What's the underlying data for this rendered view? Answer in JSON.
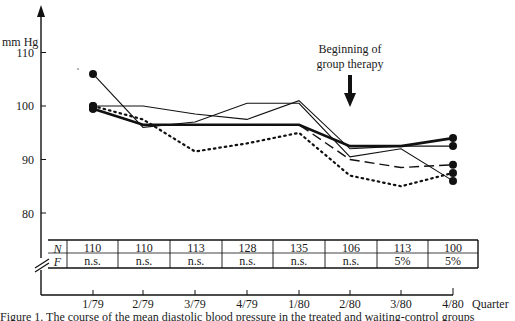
{
  "chart": {
    "y_unit_label": "mm Hg",
    "y_ticks": [
      "110",
      "100",
      "90",
      "80"
    ],
    "x_axis_label": "Quarter",
    "x_ticks": [
      "1/79",
      "2/79",
      "3/79",
      "4/79",
      "1/80",
      "2/80",
      "3/80",
      "4/80"
    ],
    "annotation_line1": "Beginning of",
    "annotation_line2": "group therapy"
  },
  "table": {
    "row_labels": [
      "N",
      "F"
    ],
    "N": [
      "110",
      "110",
      "113",
      "128",
      "135",
      "106",
      "113",
      "100"
    ],
    "F": [
      "n.s.",
      "n.s.",
      "n.s.",
      "n.s.",
      "n.s.",
      "n.s.",
      "5%",
      "5%"
    ]
  },
  "caption": "Figure 1. The course of the mean diastolic blood pressure in the treated and waiting-control groups",
  "chart_data": {
    "type": "line",
    "title": "",
    "xlabel": "Quarter",
    "ylabel": "mm Hg",
    "ylim": [
      75,
      115
    ],
    "y_ticks": [
      80,
      90,
      100,
      110
    ],
    "grid": false,
    "categories": [
      "1/79",
      "2/79",
      "3/79",
      "4/79",
      "1/80",
      "2/80",
      "3/80",
      "4/80"
    ],
    "annotations": [
      {
        "text": "Beginning of group therapy",
        "x": "2/80",
        "type": "arrow-down"
      }
    ],
    "series": [
      {
        "name": "thick solid",
        "style": "solid-thick",
        "values": [
          99.5,
          96.5,
          96.5,
          96.5,
          96.5,
          92.5,
          92.5,
          94.0
        ]
      },
      {
        "name": "thin solid A",
        "style": "solid-thin",
        "values": [
          100.0,
          100.0,
          98.5,
          97.5,
          101.0,
          92.0,
          92.5,
          92.5
        ]
      },
      {
        "name": "thin solid B",
        "style": "solid-thin",
        "values": [
          106.0,
          96.0,
          97.0,
          100.5,
          100.5,
          90.5,
          92.0,
          86.0
        ]
      },
      {
        "name": "dashed",
        "style": "dashed",
        "values": [
          99.5,
          96.5,
          96.5,
          96.5,
          96.5,
          90.0,
          88.5,
          89.0
        ]
      },
      {
        "name": "dotted",
        "style": "dotted",
        "values": [
          100.0,
          97.5,
          91.5,
          93.0,
          95.0,
          87.0,
          85.0,
          87.5
        ]
      }
    ],
    "table": {
      "rows": [
        "N",
        "F"
      ],
      "N": [
        110,
        110,
        113,
        128,
        135,
        106,
        113,
        100
      ],
      "F": [
        "n.s.",
        "n.s.",
        "n.s.",
        "n.s.",
        "n.s.",
        "n.s.",
        "5%",
        "5%"
      ]
    }
  }
}
